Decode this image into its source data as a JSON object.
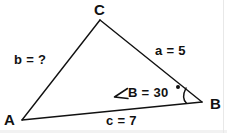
{
  "figure": {
    "type": "geometry-diagram",
    "shape": "triangle",
    "background_color": "#ffffff",
    "stroke_color": "#111111",
    "text_color": "#111111",
    "vertices": {
      "A": {
        "label": "A",
        "x": 22,
        "y": 120
      },
      "B": {
        "label": "B",
        "x": 202,
        "y": 102
      },
      "C": {
        "label": "C",
        "x": 100,
        "y": 20
      }
    },
    "sides": {
      "a": {
        "label": "a = 5",
        "value": 5,
        "between": "B-C"
      },
      "b": {
        "label": "b = ?",
        "value": null,
        "between": "A-C"
      },
      "c": {
        "label": "c = 7",
        "value": 7,
        "between": "A-B"
      }
    },
    "angle": {
      "symbol": "∠",
      "expression": "B = 30",
      "degree_mark": "°",
      "vertex": "B",
      "value": 30,
      "unit": "degrees"
    }
  }
}
